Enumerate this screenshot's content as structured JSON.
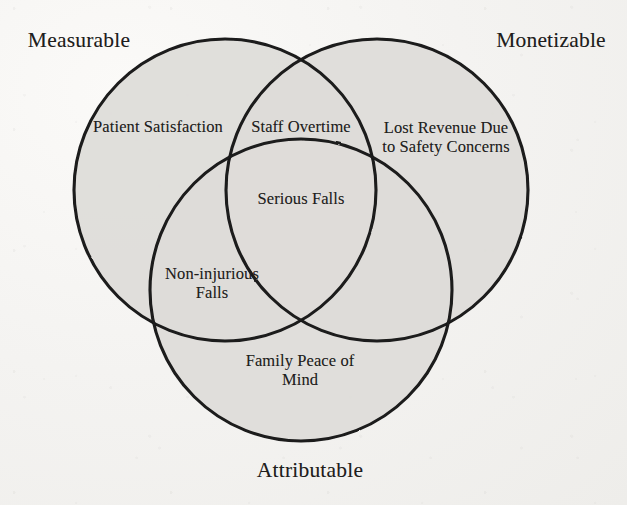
{
  "figure": {
    "type": "venn-diagram",
    "set_count": 3,
    "colors": {
      "page_background": "#f3f2f0",
      "circle_fill": "#dedcd9",
      "circle_stroke": "#1a1a1a",
      "text": "#1f1e1d"
    }
  },
  "sets": [
    {
      "id": "measurable",
      "label": "Measurable",
      "label_position": {
        "x": 79,
        "y": 40
      },
      "circle": {
        "cx": 225,
        "cy": 190,
        "r": 151
      }
    },
    {
      "id": "monetizable",
      "label": "Monetizable",
      "label_position": {
        "x": 551,
        "y": 40
      },
      "circle": {
        "cx": 377,
        "cy": 190,
        "r": 151
      }
    },
    {
      "id": "attributable",
      "label": "Attributable",
      "label_position": {
        "x": 310,
        "y": 470
      },
      "circle": {
        "cx": 301,
        "cy": 290,
        "r": 151
      }
    }
  ],
  "regions": [
    {
      "id": "measurable-only",
      "text": "Patient Satisfaction",
      "sets": [
        "measurable"
      ],
      "position": {
        "x": 158,
        "y": 127
      }
    },
    {
      "id": "measurable-monetizable",
      "text": "Staff Overtime",
      "sets": [
        "measurable",
        "monetizable"
      ],
      "position": {
        "x": 301,
        "y": 127
      }
    },
    {
      "id": "monetizable-only",
      "text": "Lost Revenue Due\nto Safety Concerns",
      "sets": [
        "monetizable"
      ],
      "position": {
        "x": 446,
        "y": 137
      }
    },
    {
      "id": "all-three",
      "text": "Serious Falls",
      "sets": [
        "measurable",
        "monetizable",
        "attributable"
      ],
      "position": {
        "x": 301,
        "y": 199
      }
    },
    {
      "id": "measurable-attributable",
      "text": "Non-injurious\nFalls",
      "sets": [
        "measurable",
        "attributable"
      ],
      "position": {
        "x": 212,
        "y": 283
      }
    },
    {
      "id": "attributable-only",
      "text": "Family Peace of\nMind",
      "sets": [
        "attributable"
      ],
      "position": {
        "x": 300,
        "y": 370
      }
    }
  ]
}
